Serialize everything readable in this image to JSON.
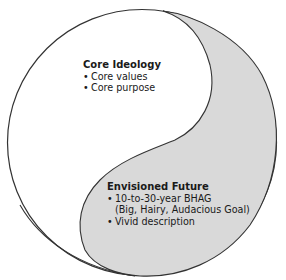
{
  "diagram": {
    "type": "yin-yang",
    "colors": {
      "outline": "#333333",
      "upper_region_fill": "#ffffff",
      "lower_region_fill": "#d9d9d9",
      "text": "#1a1a1a"
    },
    "core_ideology": {
      "title": "Core Ideology",
      "items": [
        "Core values",
        "Core purpose"
      ]
    },
    "envisioned_future": {
      "title": "Envisioned Future",
      "items": [
        {
          "line1": "10-to-30-year BHAG",
          "line2": "(Big, Hairy, Audacious Goal)"
        },
        {
          "line1": "Vivid description"
        }
      ]
    }
  }
}
